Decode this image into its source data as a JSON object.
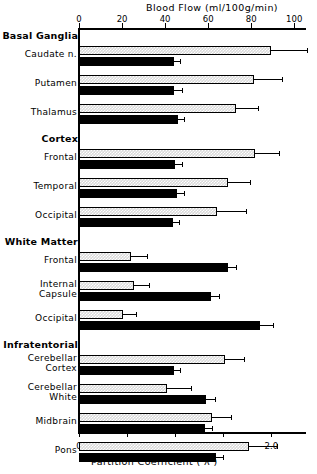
{
  "figure": {
    "top_axis_title": "Blood Flow  (ml/100g/min)",
    "bottom_axis_title": "Partition Coefficient ( λ )"
  },
  "chart_data": {
    "type": "bar",
    "orientation": "horizontal",
    "title": "Blood Flow  (ml/100g/min)",
    "xlabel": "Partition Coefficient ( λ )",
    "ylabel": "",
    "grid": false,
    "legend_position": "none",
    "top_axis": {
      "label": "Blood Flow  (ml/100g/min)",
      "ticks": [
        0,
        20,
        40,
        60,
        80,
        100
      ],
      "tick_labels": [
        "0",
        "20",
        "40",
        "60",
        "80",
        "100"
      ],
      "xlim": [
        0,
        105
      ]
    },
    "bottom_axis": {
      "label": "Partition Coefficient ( λ )",
      "ticks": [
        0,
        0.5,
        1.0,
        1.5,
        2.0
      ],
      "tick_labels": [
        "0",
        "0.5",
        "1.0",
        "1.5",
        "2.0"
      ],
      "xlim": [
        0,
        2.3
      ]
    },
    "series": [
      {
        "name": "Blood Flow",
        "style": "hatched-gray",
        "axis": "top",
        "color": "#d9d9d9"
      },
      {
        "name": "Partition Coefficient",
        "style": "solid-black",
        "axis": "bottom",
        "color": "#000000"
      }
    ],
    "groups": [
      {
        "group": "Basal Ganglia",
        "rows": [
          {
            "category": "Caudate n.",
            "blood_flow": 89.0,
            "blood_flow_err": 17.0,
            "lambda": 0.99,
            "lambda_err": 0.06
          },
          {
            "category": "Putamen",
            "blood_flow": 81.5,
            "blood_flow_err": 13.0,
            "lambda": 0.99,
            "lambda_err": 0.08
          },
          {
            "category": "Thalamus",
            "blood_flow": 73.0,
            "blood_flow_err": 10.0,
            "lambda": 1.03,
            "lambda_err": 0.06
          }
        ]
      },
      {
        "group": "Cortex",
        "rows": [
          {
            "category": "Frontal",
            "blood_flow": 82.0,
            "blood_flow_err": 11.0,
            "lambda": 1.0,
            "lambda_err": 0.07
          },
          {
            "category": "Temporal",
            "blood_flow": 69.0,
            "blood_flow_err": 10.5,
            "lambda": 1.02,
            "lambda_err": 0.07
          },
          {
            "category": "Occipital",
            "blood_flow": 64.0,
            "blood_flow_err": 13.5,
            "lambda": 0.98,
            "lambda_err": 0.06
          }
        ]
      },
      {
        "group": "White Matter",
        "rows": [
          {
            "category": "Frontal",
            "blood_flow": 24.0,
            "blood_flow_err": 7.5,
            "lambda": 1.55,
            "lambda_err": 0.08
          },
          {
            "category": "Internal\nCapsule",
            "blood_flow": 25.5,
            "blood_flow_err": 7.0,
            "lambda": 1.37,
            "lambda_err": 0.09
          },
          {
            "category": "Occipital",
            "blood_flow": 20.5,
            "blood_flow_err": 6.0,
            "lambda": 1.88,
            "lambda_err": 0.14
          }
        ]
      },
      {
        "group": "Infratentorial",
        "rows": [
          {
            "category": "Cerebellar\nCortex",
            "blood_flow": 68.0,
            "blood_flow_err": 8.5,
            "lambda": 0.99,
            "lambda_err": 0.06
          },
          {
            "category": "Cerebellar\nWhite",
            "blood_flow": 41.0,
            "blood_flow_err": 11.0,
            "lambda": 1.32,
            "lambda_err": 0.09
          },
          {
            "category": "Midbrain",
            "blood_flow": 62.0,
            "blood_flow_err": 8.5,
            "lambda": 1.31,
            "lambda_err": 0.07
          },
          {
            "category": "Pons",
            "blood_flow": 79.0,
            "blood_flow_err": 13.0,
            "lambda": 1.42,
            "lambda_err": 0.08
          }
        ]
      }
    ]
  }
}
